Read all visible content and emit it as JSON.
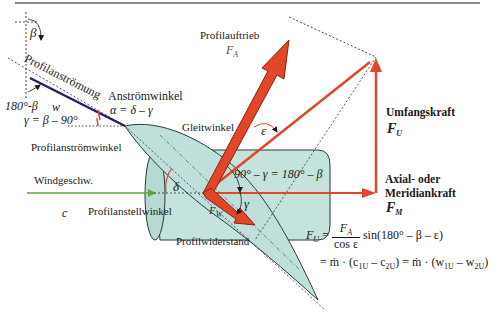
{
  "labels": {
    "beta": "β",
    "complement_beta": "180°-β",
    "w": "w",
    "gamma_def": "γ = β – 90°",
    "profilanstroemung": "Profilanströmung",
    "anstroemwinkel": "Anströmwinkel",
    "alpha_def": "α = δ – γ",
    "profilanstroemwinkel": "Profilanströmwinkel",
    "windgeschw": "Windgeschw.",
    "c": "c",
    "profilanstellwinkel": "Profilanstellwinkel",
    "delta": "δ",
    "profilauftrieb": "Profilauftrieb",
    "fa_symbol": "F",
    "fa_sub": "A",
    "gleitwinkel": "Gleitwinkel",
    "epsilon": "ε",
    "angle_relation": "90° – γ = 180° – β",
    "gamma": "γ",
    "fw_symbol": "F",
    "fw_sub": "W",
    "profilwiderstand": "Profilwiderstand",
    "umfangskraft": "Umfangskraft",
    "fu_symbol": "F",
    "fu_sub": "U",
    "axial_line1": "Axial- oder",
    "axial_line2": "Meridiankraft",
    "fm_symbol": "F",
    "fm_sub": "M"
  },
  "equation": {
    "lhs": "F",
    "lhs_sub": "U",
    "eq1": "=",
    "frac_num": "F",
    "frac_num_sub": "A",
    "frac_den": "cos ε",
    "sin_term": "sin(180° – β – ε)",
    "line2": "= ṁ · (c",
    "c1_sub": "1U",
    "minus1": " – c",
    "c2_sub": "2U",
    "mid": ") = ṁ · (w",
    "w1_sub": "1U",
    "minus2": " – w",
    "w2_sub": "2U",
    "close": ")"
  },
  "colors": {
    "force_red": "#e2452a",
    "force_dark": "#b32a14",
    "wind_green": "#5aa83c",
    "flow_navy": "#22226b",
    "blade_fill": "#bfe0da",
    "cylinder_fill": "#c4e3dd",
    "outline": "#2b3b3a"
  }
}
